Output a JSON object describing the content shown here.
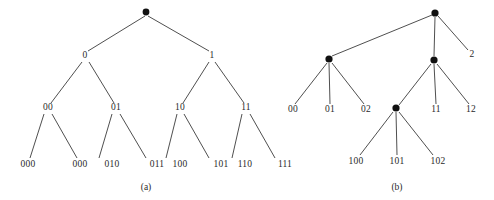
{
  "figure": {
    "background_color": "#ffffff",
    "ink_color": "#2a2a2a",
    "edge_color": "#3b3b3b",
    "node_fill_color": "#111111",
    "width": 494,
    "height": 200
  },
  "panels": [
    {
      "id": "panel-a",
      "caption": "(a)",
      "caption_x": 146,
      "caption_y": 190,
      "description": "binary prefix tree",
      "root": {
        "x": 146,
        "y": 12,
        "radius": 3.4
      },
      "nodes": [
        {
          "id": "a-root",
          "label": "",
          "x": 146,
          "y": 12,
          "is_dot": true,
          "label_x": 146,
          "label_y": 12
        },
        {
          "id": "a-0",
          "label": "0",
          "x": 85,
          "y": 58,
          "is_dot": false,
          "label_x": 85,
          "label_y": 58
        },
        {
          "id": "a-1",
          "label": "1",
          "x": 212,
          "y": 58,
          "is_dot": false,
          "label_x": 212,
          "label_y": 58
        },
        {
          "id": "a-00",
          "label": "00",
          "x": 48,
          "y": 110,
          "is_dot": false,
          "label_x": 48,
          "label_y": 110
        },
        {
          "id": "a-01",
          "label": "01",
          "x": 116,
          "y": 110,
          "is_dot": false,
          "label_x": 116,
          "label_y": 110
        },
        {
          "id": "a-10",
          "label": "10",
          "x": 180,
          "y": 110,
          "is_dot": false,
          "label_x": 180,
          "label_y": 110
        },
        {
          "id": "a-11",
          "label": "11",
          "x": 246,
          "y": 110,
          "is_dot": false,
          "label_x": 246,
          "label_y": 110
        }
      ],
      "leaves": [
        {
          "id": "a-000",
          "label": "000",
          "x": 28,
          "y": 167,
          "parent": "a-00"
        },
        {
          "id": "a-001",
          "label": "000",
          "x": 80,
          "y": 167,
          "parent": "a-00"
        },
        {
          "id": "a-010",
          "label": "010",
          "x": 112,
          "y": 167,
          "parent": "a-01"
        },
        {
          "id": "a-011",
          "label": "011",
          "x": 157,
          "y": 167,
          "parent": "a-01"
        },
        {
          "id": "a-100",
          "label": "100",
          "x": 180,
          "y": 167,
          "parent": "a-10"
        },
        {
          "id": "a-101",
          "label": "101",
          "x": 221,
          "y": 167,
          "parent": "a-10"
        },
        {
          "id": "a-110",
          "label": "110",
          "x": 245,
          "y": 167,
          "parent": "a-11"
        },
        {
          "id": "a-111",
          "label": "111",
          "x": 285,
          "y": 167,
          "parent": "a-11"
        }
      ],
      "edges": [
        {
          "from": "a-root",
          "to": "a-0",
          "x1": 145,
          "y1": 16,
          "x2": 88,
          "y2": 51
        },
        {
          "from": "a-root",
          "to": "a-1",
          "x1": 148,
          "y1": 16,
          "x2": 209,
          "y2": 51
        },
        {
          "from": "a-0",
          "to": "a-00",
          "x1": 82,
          "y1": 62,
          "x2": 51,
          "y2": 103
        },
        {
          "from": "a-0",
          "to": "a-01",
          "x1": 89,
          "y1": 62,
          "x2": 114,
          "y2": 103
        },
        {
          "from": "a-1",
          "to": "a-10",
          "x1": 209,
          "y1": 62,
          "x2": 183,
          "y2": 103
        },
        {
          "from": "a-1",
          "to": "a-11",
          "x1": 215,
          "y1": 62,
          "x2": 244,
          "y2": 103
        },
        {
          "from": "a-00",
          "to": "a-000",
          "x1": 44,
          "y1": 114,
          "x2": 30,
          "y2": 158
        },
        {
          "from": "a-00",
          "to": "a-001",
          "x1": 52,
          "y1": 114,
          "x2": 77,
          "y2": 158
        },
        {
          "from": "a-01",
          "to": "a-010",
          "x1": 112,
          "y1": 114,
          "x2": 99,
          "y2": 158
        },
        {
          "from": "a-01",
          "to": "a-011",
          "x1": 120,
          "y1": 114,
          "x2": 146,
          "y2": 158
        },
        {
          "from": "a-10",
          "to": "a-100",
          "x1": 177,
          "y1": 114,
          "x2": 166,
          "y2": 158
        },
        {
          "from": "a-10",
          "to": "a-101",
          "x1": 184,
          "y1": 114,
          "x2": 209,
          "y2": 158
        },
        {
          "from": "a-11",
          "to": "a-110",
          "x1": 242,
          "y1": 114,
          "x2": 232,
          "y2": 158
        },
        {
          "from": "a-11",
          "to": "a-111",
          "x1": 250,
          "y1": 114,
          "x2": 275,
          "y2": 158
        }
      ]
    },
    {
      "id": "panel-b",
      "caption": "(b)",
      "caption_x": 397,
      "caption_y": 190,
      "description": "ternary prefix tree",
      "root": {
        "x": 435,
        "y": 13,
        "radius": 3.6
      },
      "nodes": [
        {
          "id": "b-root",
          "label": "",
          "x": 435,
          "y": 13,
          "is_dot": true,
          "label_x": 435,
          "label_y": 13
        },
        {
          "id": "b-0",
          "label": "",
          "x": 329,
          "y": 59,
          "is_dot": true,
          "label_x": 329,
          "label_y": 59
        },
        {
          "id": "b-1",
          "label": "",
          "x": 434,
          "y": 60,
          "is_dot": true,
          "label_x": 434,
          "label_y": 60
        },
        {
          "id": "b-10",
          "label": "",
          "x": 396,
          "y": 108,
          "is_dot": true,
          "label_x": 396,
          "label_y": 108
        }
      ],
      "leaves": [
        {
          "id": "b-2",
          "label": "2",
          "x": 472,
          "y": 57,
          "parent": "b-root"
        },
        {
          "id": "b-00",
          "label": "00",
          "x": 293,
          "y": 112,
          "parent": "b-0"
        },
        {
          "id": "b-01",
          "label": "01",
          "x": 330,
          "y": 112,
          "parent": "b-0"
        },
        {
          "id": "b-02",
          "label": "02",
          "x": 366,
          "y": 112,
          "parent": "b-0"
        },
        {
          "id": "b-11",
          "label": "11",
          "x": 436,
          "y": 112,
          "parent": "b-1"
        },
        {
          "id": "b-12",
          "label": "12",
          "x": 471,
          "y": 112,
          "parent": "b-1"
        },
        {
          "id": "b-100",
          "label": "100",
          "x": 356,
          "y": 164,
          "parent": "b-10"
        },
        {
          "id": "b-101",
          "label": "101",
          "x": 397,
          "y": 164,
          "parent": "b-10"
        },
        {
          "id": "b-102",
          "label": "102",
          "x": 438,
          "y": 164,
          "parent": "b-10"
        }
      ],
      "edges": [
        {
          "from": "b-root",
          "to": "b-0",
          "x1": 432,
          "y1": 15,
          "x2": 332,
          "y2": 56
        },
        {
          "from": "b-root",
          "to": "b-1",
          "x1": 435,
          "y1": 17,
          "x2": 434,
          "y2": 56
        },
        {
          "from": "b-root",
          "to": "b-2",
          "x1": 438,
          "y1": 16,
          "x2": 468,
          "y2": 50
        },
        {
          "from": "b-0",
          "to": "b-00",
          "x1": 327,
          "y1": 63,
          "x2": 295,
          "y2": 104
        },
        {
          "from": "b-0",
          "to": "b-01",
          "x1": 329,
          "y1": 63,
          "x2": 330,
          "y2": 104
        },
        {
          "from": "b-0",
          "to": "b-02",
          "x1": 332,
          "y1": 63,
          "x2": 364,
          "y2": 104
        },
        {
          "from": "b-1",
          "to": "b-10",
          "x1": 431,
          "y1": 64,
          "x2": 399,
          "y2": 105
        },
        {
          "from": "b-1",
          "to": "b-11",
          "x1": 434,
          "y1": 64,
          "x2": 436,
          "y2": 104
        },
        {
          "from": "b-1",
          "to": "b-12",
          "x1": 437,
          "y1": 64,
          "x2": 469,
          "y2": 104
        },
        {
          "from": "b-10",
          "to": "b-100",
          "x1": 393,
          "y1": 112,
          "x2": 360,
          "y2": 155
        },
        {
          "from": "b-10",
          "to": "b-101",
          "x1": 396,
          "y1": 112,
          "x2": 397,
          "y2": 155
        },
        {
          "from": "b-10",
          "to": "b-102",
          "x1": 399,
          "y1": 112,
          "x2": 433,
          "y2": 155
        }
      ]
    }
  ]
}
